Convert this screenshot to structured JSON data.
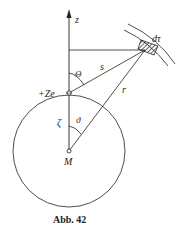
{
  "diagram": {
    "labels": {
      "z_axis": "z",
      "volume_element": "dτ",
      "charge": "+Ze",
      "distance_s": "s",
      "distance_r": "r",
      "angle_theta": "Θ",
      "angle_vartheta": "ϑ",
      "zeta": "ζ",
      "center": "M"
    },
    "caption": "Abb. 42",
    "colors": {
      "line": "#222222",
      "background": "#ffffff"
    }
  }
}
